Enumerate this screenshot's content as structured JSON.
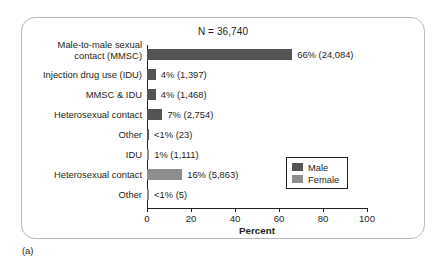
{
  "figure": {
    "caption": "(a)"
  },
  "chart_data": {
    "type": "bar",
    "orientation": "horizontal",
    "title": "N = 36,740",
    "xlabel": "Percent",
    "ylabel": "",
    "xlim": [
      0,
      100
    ],
    "xticks": [
      0,
      20,
      40,
      60,
      80,
      100
    ],
    "xtick_labels": [
      "0",
      "20",
      "40",
      "60",
      "80",
      "100"
    ],
    "grid": false,
    "legend_position": "right-lower",
    "legend": [
      {
        "name": "Male",
        "color": "#545454"
      },
      {
        "name": "Female",
        "color": "#8d8d8d"
      }
    ],
    "categories": [
      "Male-to-male sexual\ncontact (MMSC)",
      "Injection drug use (IDU)",
      "MMSC & IDU",
      "Heterosexual contact",
      "Other",
      "IDU",
      "Heterosexual contact",
      "Other"
    ],
    "values": [
      66,
      4,
      4,
      7,
      0.4,
      1,
      16,
      0.3
    ],
    "data_labels": [
      "66% (24,084)",
      "4% (1,397)",
      "4% (1,468)",
      "7% (2,754)",
      "<1% (23)",
      "1% (1,111)",
      "16% (5,863)",
      "<1% (5)"
    ],
    "counts": [
      24084,
      1397,
      1468,
      2754,
      23,
      1111,
      5863,
      5
    ],
    "series_of_row": [
      "Male",
      "Male",
      "Male",
      "Male",
      "Male",
      "Female",
      "Female",
      "Female"
    ],
    "rows": [
      {
        "label": "Male-to-male sexual\ncontact (MMSC)",
        "value": 66,
        "data_label": "66% (24,084)",
        "series": "Male",
        "two_line": true
      },
      {
        "label": "Injection drug use (IDU)",
        "value": 4,
        "data_label": "4% (1,397)",
        "series": "Male",
        "two_line": false
      },
      {
        "label": "MMSC & IDU",
        "value": 4,
        "data_label": "4% (1,468)",
        "series": "Male",
        "two_line": false
      },
      {
        "label": "Heterosexual contact",
        "value": 7,
        "data_label": "7% (2,754)",
        "series": "Male",
        "two_line": false
      },
      {
        "label": "Other",
        "value": 0.4,
        "data_label": "<1% (23)",
        "series": "Male",
        "two_line": false
      },
      {
        "label": "IDU",
        "value": 1,
        "data_label": "1% (1,111)",
        "series": "Female",
        "two_line": false
      },
      {
        "label": "Heterosexual contact",
        "value": 16,
        "data_label": "16% (5,863)",
        "series": "Female",
        "two_line": false
      },
      {
        "label": "Other",
        "value": 0.3,
        "data_label": "<1% (5)",
        "series": "Female",
        "two_line": false
      }
    ]
  }
}
